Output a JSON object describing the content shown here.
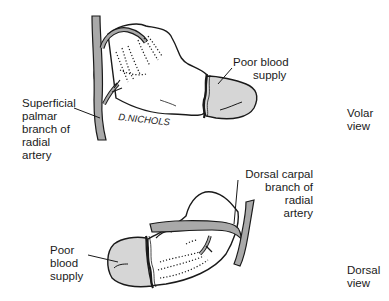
{
  "diagram": {
    "colors": {
      "artery": "#a9a9a9",
      "poor_supply": "#d6d6d6",
      "outline": "#1a1a1a",
      "background": "#ffffff"
    },
    "volar_view": {
      "view_label": [
        "Volar",
        "view"
      ],
      "labels": {
        "superficial_palmar": [
          "Superficial",
          "palmar",
          "branch of",
          "radial",
          "artery"
        ],
        "poor_blood_supply": [
          "Poor blood",
          "supply"
        ]
      },
      "signature": "D.NICHOLS"
    },
    "dorsal_view": {
      "view_label": [
        "Dorsal",
        "view"
      ],
      "labels": {
        "dorsal_carpal": [
          "Dorsal carpal",
          "branch of",
          "radial",
          "artery"
        ],
        "poor_blood_supply": [
          "Poor",
          "blood",
          "supply"
        ]
      }
    }
  }
}
